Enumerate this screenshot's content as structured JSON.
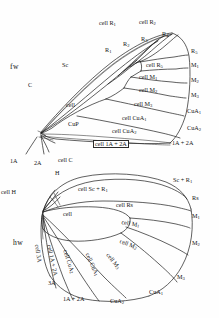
{
  "figure": {
    "type": "insect-wing-venation-diagram",
    "wings": [
      {
        "id": "forewing",
        "tag": "fw"
      },
      {
        "id": "hindwing",
        "tag": "hw"
      }
    ]
  },
  "forewing": {
    "tag": "fw",
    "vein_labels": [
      {
        "key": "c",
        "text": "C",
        "x": 30,
        "y": 86
      },
      {
        "key": "sc",
        "text": "Sc",
        "x": 64,
        "y": 66
      },
      {
        "key": "r1",
        "text": "R",
        "sub": "1",
        "x": 107,
        "y": 51
      },
      {
        "key": "r2",
        "text": "R",
        "sub": "2",
        "x": 125,
        "y": 45
      },
      {
        "key": "r3",
        "text": "R",
        "sub": "3",
        "x": 143,
        "y": 41
      },
      {
        "key": "r4",
        "text": "R",
        "sub": "4",
        "x": 163,
        "y": 36
      },
      {
        "key": "r5",
        "text": "R",
        "sub": "5",
        "x": 184,
        "y": 52
      },
      {
        "key": "m1",
        "text": "M",
        "sub": "1",
        "x": 185,
        "y": 66
      },
      {
        "key": "m2",
        "text": "M",
        "sub": "2",
        "x": 185,
        "y": 80
      },
      {
        "key": "m3",
        "text": "M",
        "sub": "3",
        "x": 185,
        "y": 94
      },
      {
        "key": "cua1",
        "text": "CuA",
        "sub": "1",
        "x": 183,
        "y": 110
      },
      {
        "key": "cua2",
        "text": "CuA",
        "sub": "2",
        "x": 183,
        "y": 126
      },
      {
        "key": "cup",
        "text": "CuP",
        "x": 70,
        "y": 125
      },
      {
        "key": "a12",
        "text": "1A + 2A",
        "x": 174,
        "y": 141
      },
      {
        "key": "a1",
        "text": "1A",
        "x": 14,
        "y": 160
      },
      {
        "key": "a2",
        "text": "2A",
        "x": 37,
        "y": 161
      }
    ],
    "cell_labels": [
      {
        "key": "cell_r1",
        "text": "cell R",
        "sub": "1",
        "x": 99,
        "y": 23
      },
      {
        "key": "cell_r2",
        "text": "cell R",
        "sub": "2",
        "x": 139,
        "y": 22
      },
      {
        "key": "cell_r5",
        "text": "cell R",
        "sub": "5",
        "x": 148,
        "y": 66
      },
      {
        "key": "cell_m1",
        "text": "cell M",
        "sub": "1",
        "x": 141,
        "y": 78
      },
      {
        "key": "cell_m2",
        "text": "cell M",
        "sub": "2",
        "x": 141,
        "y": 90
      },
      {
        "key": "cell_m3",
        "text": "cell M",
        "sub": "3",
        "x": 136,
        "y": 104
      },
      {
        "key": "cell_cua1",
        "text": "cell CuA",
        "sub": "1",
        "x": 124,
        "y": 118
      },
      {
        "key": "cell_cua2",
        "text": "cell CuA",
        "sub": "2",
        "x": 114,
        "y": 131
      },
      {
        "key": "cell_a12",
        "text": "cell 1A + 2A",
        "x": 95,
        "y": 143,
        "boxed": true
      },
      {
        "key": "cell_disc",
        "text": "cell",
        "x": 68,
        "y": 105
      }
    ],
    "leader_lines": [
      {
        "from": [
          116,
          31
        ],
        "to": [
          125,
          44
        ]
      },
      {
        "from": [
          152,
          30
        ],
        "to": [
          146,
          44
        ]
      }
    ]
  },
  "hindwing": {
    "tag": "hw",
    "vein_labels": [
      {
        "key": "h",
        "text": "H",
        "x": 57,
        "y": 174
      },
      {
        "key": "scr1",
        "text": "Sc + R",
        "sub": "1",
        "x": 177,
        "y": 180
      },
      {
        "key": "rs",
        "text": "Rs",
        "x": 192,
        "y": 198
      },
      {
        "key": "m1",
        "text": "M",
        "sub": "1",
        "x": 192,
        "y": 216
      },
      {
        "key": "m2",
        "text": "M",
        "sub": "2",
        "x": 192,
        "y": 243
      },
      {
        "key": "m3",
        "text": "M",
        "sub": "3",
        "x": 178,
        "y": 277
      },
      {
        "key": "cua1",
        "text": "CuA",
        "sub": "1",
        "x": 151,
        "y": 292
      },
      {
        "key": "cua2",
        "text": "CuA",
        "sub": "2",
        "x": 113,
        "y": 301
      },
      {
        "key": "a12",
        "text": "1A + 2A",
        "x": 66,
        "y": 299
      },
      {
        "key": "a3",
        "text": "3A",
        "x": 50,
        "y": 283
      }
    ],
    "cell_labels": [
      {
        "key": "cell_c",
        "text": "cell C",
        "x": 60,
        "y": 160
      },
      {
        "key": "cell_h",
        "text": "cell H",
        "x": 3,
        "y": 192
      },
      {
        "key": "cell_scr1",
        "text": "cell Sc + R",
        "sub": "1",
        "x": 80,
        "y": 189
      },
      {
        "key": "cell_rs",
        "text": "cell Rs",
        "x": 118,
        "y": 205
      },
      {
        "key": "cell_m1",
        "text": "cell M",
        "sub": "1",
        "x": 124,
        "y": 222
      },
      {
        "key": "cell_m2",
        "text": "cell M",
        "sub": "2",
        "x": 125,
        "y": 241
      },
      {
        "key": "cell_m3",
        "text": "cell M",
        "sub": "3",
        "x": 112,
        "y": 256
      },
      {
        "key": "cell_cua1",
        "text": "cell CuA",
        "sub": "1",
        "x": 93,
        "y": 258
      },
      {
        "key": "cell_cua2",
        "text": "cell CuA",
        "sub": "2",
        "x": 71,
        "y": 257
      },
      {
        "key": "cell_a12",
        "text": "cell 1A + 2A",
        "x": 54,
        "y": 255
      },
      {
        "key": "cell_3a",
        "text": "cell 3A",
        "x": 40,
        "y": 255
      },
      {
        "key": "cell_disc",
        "text": "cell",
        "x": 65,
        "y": 214
      }
    ],
    "leader_lines": [
      {
        "from": [
          76,
          165
        ],
        "to": [
          76,
          178
        ]
      },
      {
        "from": [
          21,
          193
        ],
        "to": [
          33,
          197
        ]
      },
      {
        "from": [
          62,
          180
        ],
        "to": [
          58,
          188
        ]
      }
    ]
  },
  "style": {
    "stroke": "#1d1d1d",
    "background": "#ffffff"
  }
}
